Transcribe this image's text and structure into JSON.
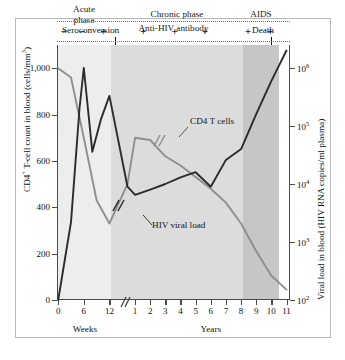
{
  "chart_data": {
    "type": "line",
    "title": "",
    "xlabel_groups": [
      "Weeks",
      "Years"
    ],
    "x_break": true,
    "x_ticks_weeks": [
      "0",
      "6",
      "12"
    ],
    "x_ticks_years": [
      "1",
      "2",
      "3",
      "4",
      "5",
      "6",
      "7",
      "8",
      "9",
      "10",
      "11"
    ],
    "left_axis": {
      "label": "CD4",
      "label_sup": "+",
      "label_rest": " T-cell count in blood (cells/mm",
      "label_sup2": "3",
      "label_end": ")",
      "ticks": [
        "0",
        "200",
        "400",
        "600",
        "800",
        "1,000"
      ],
      "ylim": [
        0,
        1100
      ],
      "scale": "linear"
    },
    "right_axis": {
      "label": "Viral load in blood (HIV RNA copies/ml plasma)",
      "ticks": [
        "10",
        "10",
        "10",
        "10",
        "10"
      ],
      "tick_exponents": [
        "2",
        "3",
        "4",
        "5",
        "6"
      ],
      "ylim": [
        100,
        1000000
      ],
      "scale": "log"
    },
    "series": [
      {
        "name": "CD4 T cells",
        "color": "#8f8f8f",
        "axis": "left",
        "points": [
          {
            "t": 0,
            "v": 1000
          },
          {
            "t": 3,
            "v": 960
          },
          {
            "t": 6,
            "v": 700
          },
          {
            "t": 9,
            "v": 430
          },
          {
            "t": 12,
            "v": 330
          },
          {
            "t": 26,
            "v": 500
          },
          {
            "t": 52,
            "v": 700
          },
          {
            "t": 104,
            "v": 690
          },
          {
            "t": 156,
            "v": 620
          },
          {
            "t": 208,
            "v": 580
          },
          {
            "t": 260,
            "v": 530
          },
          {
            "t": 312,
            "v": 480
          },
          {
            "t": 364,
            "v": 420
          },
          {
            "t": 416,
            "v": 330
          },
          {
            "t": 468,
            "v": 210
          },
          {
            "t": 520,
            "v": 105
          },
          {
            "t": 572,
            "v": 45
          }
        ]
      },
      {
        "name": "HIV viral load",
        "color": "#2b2b2b",
        "axis": "right",
        "points": [
          {
            "t": 0,
            "v": 100
          },
          {
            "t": 3,
            "v": 2200
          },
          {
            "t": 5,
            "v": 200000
          },
          {
            "t": 6,
            "v": 1000000
          },
          {
            "t": 8,
            "v": 36000
          },
          {
            "t": 10,
            "v": 130000
          },
          {
            "t": 12,
            "v": 330000
          },
          {
            "t": 26,
            "v": 9000
          },
          {
            "t": 52,
            "v": 6500
          },
          {
            "t": 104,
            "v": 8000
          },
          {
            "t": 156,
            "v": 10000
          },
          {
            "t": 208,
            "v": 13000
          },
          {
            "t": 260,
            "v": 16000
          },
          {
            "t": 312,
            "v": 9000
          },
          {
            "t": 364,
            "v": 26000
          },
          {
            "t": 416,
            "v": 40000
          },
          {
            "t": 468,
            "v": 160000
          },
          {
            "t": 520,
            "v": 600000
          },
          {
            "t": 572,
            "v": 2000000
          }
        ]
      }
    ],
    "annotations": {
      "curve_labels": [
        {
          "name": "cd4-curve-label",
          "text": "CD4 T cells"
        },
        {
          "name": "viral-curve-label",
          "text": "HIV viral load"
        }
      ]
    }
  },
  "phases": [
    {
      "key": "acute",
      "label": "Acute\nphase",
      "line1": "Acute",
      "line2": "phase",
      "color": "#ededed"
    },
    {
      "key": "chronic",
      "label": "Chronic phase",
      "line1": "Chronic phase",
      "line2": "",
      "color": "#dcdcdc"
    },
    {
      "key": "aids",
      "label": "AIDS",
      "line1": "AIDS",
      "line2": "",
      "color": "#c6c6c6"
    }
  ],
  "callouts": [
    {
      "key": "seroconversion",
      "text": "Seroconversion"
    },
    {
      "key": "death",
      "text": "Death"
    }
  ],
  "antibody": {
    "label": "Anti-HIV antibody",
    "signs": [
      "−",
      "−",
      "+",
      "+",
      "+",
      "+",
      "+",
      "+"
    ]
  }
}
